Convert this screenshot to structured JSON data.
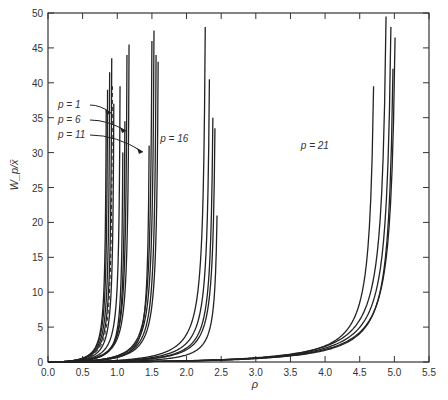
{
  "chart_data": {
    "type": "line",
    "title": "",
    "xlabel": "ρ",
    "ylabel": "W_p/x̄",
    "xlim": [
      0.0,
      5.5
    ],
    "ylim": [
      0,
      50
    ],
    "x_ticks": [
      "0.0",
      "0.5",
      "1.0",
      "1.5",
      "2.0",
      "2.5",
      "3.0",
      "3.5",
      "4.0",
      "4.5",
      "5.0",
      "5.5"
    ],
    "y_ticks": [
      "0",
      "5",
      "10",
      "15",
      "20",
      "25",
      "30",
      "35",
      "40",
      "45",
      "50"
    ],
    "grid": false,
    "legend": "none (inline annotations)",
    "annotations": [
      {
        "text": "p = 1",
        "x": 0.78,
        "y": 35.5
      },
      {
        "text": "p = 6",
        "x": 1.08,
        "y": 33.0
      },
      {
        "text": "p = 11",
        "x": 1.5,
        "y": 30.0
      },
      {
        "text": "p = 16",
        "x": 1.62,
        "y": 31.5
      },
      {
        "text": "p = 21",
        "x": 3.65,
        "y": 30.5
      }
    ],
    "groups": [
      {
        "name": "p = 1",
        "curves": [
          {
            "end_x": 0.84,
            "end_y": 36.0
          },
          {
            "end_x": 0.86,
            "end_y": 39.0
          },
          {
            "end_x": 0.89,
            "end_y": 41.5
          },
          {
            "end_x": 0.92,
            "end_y": 43.5
          },
          {
            "end_x": 0.95,
            "end_y": 37.0
          },
          {
            "end_x": 0.93,
            "end_y": 39.5,
            "dashed": true
          }
        ]
      },
      {
        "name": "p = 6",
        "curves": [
          {
            "end_x": 1.04,
            "end_y": 39.5
          },
          {
            "end_x": 1.08,
            "end_y": 30.0
          },
          {
            "end_x": 1.11,
            "end_y": 34.5
          },
          {
            "end_x": 1.14,
            "end_y": 44.0
          },
          {
            "end_x": 1.17,
            "end_y": 45.5
          }
        ]
      },
      {
        "name": "p = 11",
        "curves": [
          {
            "end_x": 1.46,
            "end_y": 31.0
          },
          {
            "end_x": 1.5,
            "end_y": 46.0
          },
          {
            "end_x": 1.53,
            "end_y": 47.5
          },
          {
            "end_x": 1.56,
            "end_y": 44.0
          },
          {
            "end_x": 1.59,
            "end_y": 43.0
          }
        ]
      },
      {
        "name": "p = 16",
        "curves": [
          {
            "end_x": 2.27,
            "end_y": 48.0
          },
          {
            "end_x": 2.33,
            "end_y": 40.5
          },
          {
            "end_x": 2.38,
            "end_y": 35.0
          },
          {
            "end_x": 2.41,
            "end_y": 33.5
          },
          {
            "end_x": 2.44,
            "end_y": 21.0
          }
        ]
      },
      {
        "name": "p = 21",
        "curves": [
          {
            "end_x": 4.7,
            "end_y": 39.5
          },
          {
            "end_x": 4.88,
            "end_y": 49.5
          },
          {
            "end_x": 4.95,
            "end_y": 48.0
          },
          {
            "end_x": 4.98,
            "end_y": 42.0
          },
          {
            "end_x": 5.01,
            "end_y": 46.5
          }
        ]
      }
    ]
  }
}
